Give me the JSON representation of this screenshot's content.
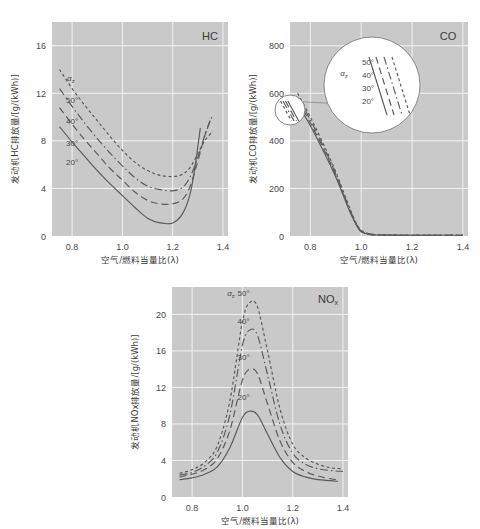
{
  "figure": {
    "axis_x_label": "空气/燃料当量比(λ)",
    "alpha_symbol": "α",
    "alpha_sub": "z"
  },
  "chart_data": [
    {
      "type": "line",
      "title": "HC",
      "panel": "hc",
      "xlabel": "空气/燃料当量比(λ)",
      "ylabel": "发动机HC排放量/[g/(kWh)]",
      "xlim": [
        0.72,
        1.42
      ],
      "ylim": [
        0,
        18
      ],
      "xticks": [
        "0.8",
        "1.0",
        "1.2",
        "1.4"
      ],
      "xtickvals": [
        0.8,
        1.0,
        1.2,
        1.4
      ],
      "yticks": [
        "0",
        "4",
        "8",
        "12",
        "16"
      ],
      "ytickvals": [
        0,
        4,
        8,
        12,
        16
      ],
      "grid": true,
      "legend_title": "αz",
      "series": [
        {
          "name": "50°",
          "style": "dotted",
          "x": [
            0.75,
            0.8,
            0.85,
            0.9,
            0.95,
            1.0,
            1.05,
            1.1,
            1.15,
            1.2,
            1.24,
            1.27,
            1.3,
            1.33,
            1.36
          ],
          "values": [
            14.0,
            12.4,
            11.0,
            9.7,
            8.4,
            7.2,
            6.2,
            5.5,
            5.1,
            5.0,
            5.2,
            5.8,
            6.9,
            8.1,
            8.8
          ]
        },
        {
          "name": "40°",
          "style": "dashdot",
          "x": [
            0.75,
            0.8,
            0.85,
            0.9,
            0.95,
            1.0,
            1.05,
            1.1,
            1.15,
            1.2,
            1.24,
            1.27,
            1.3,
            1.33,
            1.36
          ],
          "values": [
            12.4,
            10.9,
            9.5,
            8.2,
            7.0,
            5.9,
            4.9,
            4.2,
            3.9,
            3.8,
            4.1,
            5.0,
            6.6,
            8.6,
            10.2
          ]
        },
        {
          "name": "30°",
          "style": "longdash",
          "x": [
            0.75,
            0.8,
            0.85,
            0.9,
            0.95,
            1.0,
            1.05,
            1.1,
            1.15,
            1.2,
            1.24,
            1.27,
            1.3,
            1.33,
            1.35
          ],
          "values": [
            10.8,
            9.4,
            8.1,
            6.9,
            5.7,
            4.7,
            3.7,
            3.0,
            2.7,
            2.7,
            3.1,
            4.2,
            6.3,
            8.6,
            9.8
          ]
        },
        {
          "name": "20°",
          "style": "solid",
          "x": [
            0.75,
            0.8,
            0.85,
            0.9,
            0.95,
            1.0,
            1.05,
            1.1,
            1.15,
            1.2,
            1.24,
            1.27,
            1.29,
            1.31
          ],
          "values": [
            9.2,
            7.9,
            6.7,
            5.5,
            4.4,
            3.4,
            2.4,
            1.5,
            1.1,
            1.1,
            1.9,
            3.6,
            6.0,
            9.1
          ]
        }
      ]
    },
    {
      "type": "line",
      "title": "CO",
      "panel": "co",
      "xlabel": "空气/燃料当量比(λ)",
      "ylabel": "发动机CO排放量/[g/(kWh)]",
      "xlim": [
        0.72,
        1.42
      ],
      "ylim": [
        0,
        900
      ],
      "xticks": [
        "0.8",
        "1.0",
        "1.2",
        "1.4"
      ],
      "xtickvals": [
        0.8,
        1.0,
        1.2,
        1.4
      ],
      "yticks": [
        "0",
        "200",
        "400",
        "600",
        "800"
      ],
      "ytickvals": [
        0,
        200,
        400,
        600,
        800
      ],
      "grid": true,
      "legend_title": "αz",
      "inset": {
        "labels": [
          "50°",
          "40°",
          "30°",
          "20°"
        ],
        "legend_title": "αz"
      },
      "series": [
        {
          "name": "50°",
          "style": "dotted",
          "x": [
            0.75,
            0.8,
            0.85,
            0.9,
            0.95,
            0.98,
            1.0,
            1.03,
            1.06,
            1.1,
            1.2,
            1.3,
            1.4
          ],
          "values": [
            600,
            500,
            390,
            270,
            130,
            55,
            25,
            10,
            6,
            5,
            4,
            4,
            4
          ]
        },
        {
          "name": "40°",
          "style": "dashdot",
          "x": [
            0.75,
            0.8,
            0.85,
            0.9,
            0.95,
            0.98,
            1.0,
            1.03,
            1.06,
            1.1,
            1.2,
            1.3,
            1.4
          ],
          "values": [
            585,
            488,
            380,
            262,
            125,
            52,
            22,
            9,
            5,
            4,
            3,
            3,
            3
          ]
        },
        {
          "name": "30°",
          "style": "longdash",
          "x": [
            0.75,
            0.8,
            0.85,
            0.9,
            0.95,
            0.98,
            1.0,
            1.03,
            1.06,
            1.1,
            1.2,
            1.3,
            1.4
          ],
          "values": [
            570,
            476,
            370,
            255,
            120,
            50,
            20,
            8,
            5,
            4,
            3,
            3,
            3
          ]
        },
        {
          "name": "20°",
          "style": "solid",
          "x": [
            0.75,
            0.8,
            0.85,
            0.9,
            0.95,
            0.98,
            1.0,
            1.03,
            1.06,
            1.1,
            1.2,
            1.3,
            1.4
          ],
          "values": [
            556,
            464,
            360,
            248,
            116,
            48,
            18,
            7,
            4,
            3,
            3,
            3,
            3
          ]
        }
      ]
    },
    {
      "type": "line",
      "title": "NOx",
      "title_main": "NO",
      "title_sub": "x",
      "panel": "nox",
      "xlabel": "空气/燃料当量比(λ)",
      "ylabel": "发动机NOx排放量/[g/(kWh)]",
      "xlim": [
        0.72,
        1.42
      ],
      "ylim": [
        0,
        23
      ],
      "xticks": [
        "0.8",
        "1.0",
        "1.2",
        "1.4"
      ],
      "xtickvals": [
        0.8,
        1.0,
        1.2,
        1.4
      ],
      "yticks": [
        "0",
        "4",
        "8",
        "12",
        "16",
        "20"
      ],
      "ytickvals": [
        0,
        4,
        8,
        12,
        16,
        20
      ],
      "grid": true,
      "legend_title": "αz",
      "series": [
        {
          "name": "50°",
          "style": "dotted",
          "x": [
            0.75,
            0.8,
            0.85,
            0.9,
            0.95,
            1.0,
            1.03,
            1.06,
            1.1,
            1.15,
            1.2,
            1.25,
            1.3,
            1.35,
            1.4
          ],
          "values": [
            2.6,
            3.0,
            3.8,
            5.6,
            10.5,
            19.2,
            21.3,
            20.8,
            16.0,
            9.6,
            5.8,
            4.3,
            3.6,
            3.2,
            3.1
          ]
        },
        {
          "name": "40°",
          "style": "dashdot",
          "x": [
            0.75,
            0.8,
            0.85,
            0.9,
            0.95,
            1.0,
            1.03,
            1.06,
            1.1,
            1.15,
            1.2,
            1.25,
            1.3,
            1.35,
            1.4
          ],
          "values": [
            2.4,
            2.7,
            3.4,
            4.9,
            9.0,
            16.6,
            18.3,
            17.7,
            13.4,
            7.9,
            4.8,
            3.6,
            3.1,
            2.9,
            2.8
          ]
        },
        {
          "name": "30°",
          "style": "longdash",
          "x": [
            0.75,
            0.8,
            0.85,
            0.9,
            0.95,
            1.0,
            1.03,
            1.06,
            1.1,
            1.15,
            1.2,
            1.25,
            1.3,
            1.35,
            1.38
          ],
          "values": [
            2.2,
            2.5,
            3.0,
            4.2,
            7.3,
            12.8,
            14.0,
            13.5,
            10.2,
            6.1,
            3.8,
            2.8,
            2.3,
            2.0,
            1.9
          ]
        },
        {
          "name": "20°",
          "style": "solid",
          "x": [
            0.75,
            0.8,
            0.85,
            0.9,
            0.95,
            1.0,
            1.03,
            1.06,
            1.1,
            1.15,
            1.2,
            1.25,
            1.3,
            1.35,
            1.38
          ],
          "values": [
            1.9,
            2.1,
            2.5,
            3.3,
            5.4,
            8.7,
            9.4,
            9.0,
            6.9,
            4.3,
            2.8,
            2.2,
            1.9,
            1.8,
            1.7
          ]
        }
      ]
    }
  ]
}
